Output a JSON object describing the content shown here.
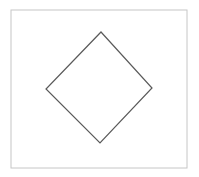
{
  "figure": {
    "canvas": {
      "width": 199,
      "height": 177,
      "background_color": "#ffffff"
    },
    "frame": {
      "name": "outer-frame",
      "shape": "rectangle",
      "x": 11,
      "y": 10,
      "width": 176,
      "height": 158,
      "stroke_color": "#c6c6c6",
      "stroke_width": 1,
      "fill": "none"
    },
    "diamond": {
      "name": "diamond-outline",
      "shape": "quadrilateral",
      "description": "rotated square, slightly tilted",
      "vertices": [
        {
          "label": "top",
          "x": 101,
          "y": 32
        },
        {
          "label": "right",
          "x": 152,
          "y": 88
        },
        {
          "label": "bottom",
          "x": 100,
          "y": 143
        },
        {
          "label": "left",
          "x": 46,
          "y": 89
        }
      ],
      "points_attr": "101,32 152,88 100,143 46,89",
      "stroke_color": "#5a5a5a",
      "stroke_width": 1.2,
      "fill": "none"
    }
  }
}
